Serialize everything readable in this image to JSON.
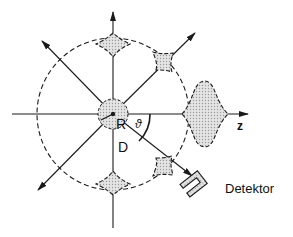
{
  "diagram": {
    "labels": {
      "radius": "R",
      "distance": "D",
      "angle": "ϑ",
      "axis": "z",
      "detector": "Detektor"
    },
    "colors": {
      "line": "#1a1a1a",
      "fill": "#cfcfcf",
      "background": "#ffffff"
    }
  }
}
